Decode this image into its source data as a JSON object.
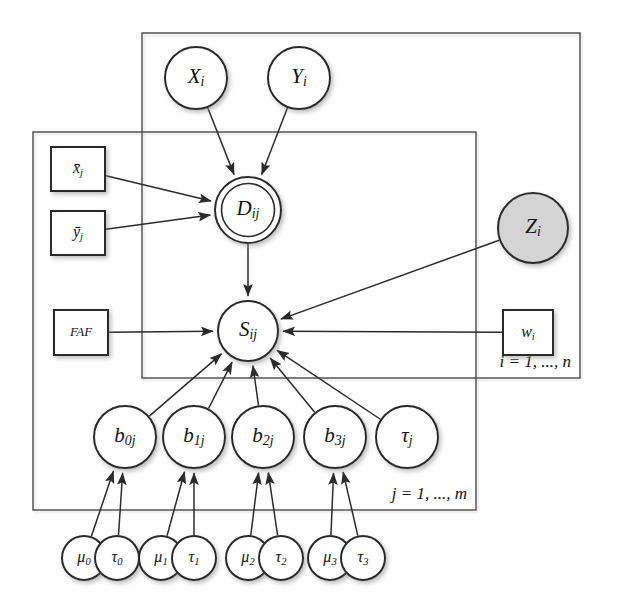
{
  "figure": {
    "kind": "bayesian-network-plate-diagram",
    "background_color": "#ffffff",
    "stroke_color": "#2b2b2b",
    "shaded_node_color": "#d4d4d4"
  },
  "plates": [
    {
      "id": "plate-i",
      "label": "i = 1, ..., n",
      "x": 142,
      "y": 33,
      "width": 438,
      "height": 345
    },
    {
      "id": "plate-j",
      "label": "j = 1, ..., m",
      "x": 33,
      "y": 132,
      "width": 443,
      "height": 378
    }
  ],
  "nodes": {
    "x_i": {
      "label": "X",
      "sub": "i",
      "shape": "circle",
      "style": "latent",
      "cx": 196,
      "cy": 78,
      "r": 31
    },
    "y_i": {
      "label": "Y",
      "sub": "i",
      "shape": "circle",
      "style": "latent",
      "cx": 299,
      "cy": 78,
      "r": 31
    },
    "d_ij": {
      "label": "D",
      "sub": "ij",
      "shape": "circle",
      "style": "observed",
      "cx": 248,
      "cy": 210,
      "r": 33
    },
    "s_ij": {
      "label": "S",
      "sub": "ij",
      "shape": "circle",
      "style": "latent",
      "cx": 248,
      "cy": 331,
      "r": 30
    },
    "z_i": {
      "label": "Z",
      "sub": "i",
      "shape": "circle",
      "style": "shaded",
      "cx": 533,
      "cy": 228,
      "r": 35
    },
    "xbar_j": {
      "label": "x̄",
      "sub": "j",
      "shape": "rect",
      "style": "fixed",
      "x": 51,
      "y": 147,
      "width": 54,
      "height": 44
    },
    "ybar_j": {
      "label": "ȳ",
      "sub": "j",
      "shape": "rect",
      "style": "fixed",
      "x": 51,
      "y": 211,
      "width": 54,
      "height": 44
    },
    "faf": {
      "label": "FAF",
      "sub": "",
      "shape": "rect",
      "style": "fixed",
      "x": 54,
      "y": 310,
      "width": 54,
      "height": 45
    },
    "w_i": {
      "label": "w",
      "sub": "i",
      "shape": "rect",
      "style": "fixed",
      "x": 503,
      "y": 310,
      "width": 50,
      "height": 45
    },
    "b0_j": {
      "label": "b",
      "sub": "0j",
      "shape": "circle",
      "style": "latent",
      "cx": 125,
      "cy": 437,
      "r": 31
    },
    "b1_j": {
      "label": "b",
      "sub": "1j",
      "shape": "circle",
      "style": "latent",
      "cx": 194,
      "cy": 437,
      "r": 31
    },
    "b2_j": {
      "label": "b",
      "sub": "2j",
      "shape": "circle",
      "style": "latent",
      "cx": 263,
      "cy": 437,
      "r": 31
    },
    "b3_j": {
      "label": "b",
      "sub": "3j",
      "shape": "circle",
      "style": "latent",
      "cx": 335,
      "cy": 437,
      "r": 31
    },
    "tau_j": {
      "label": "τ",
      "sub": "j",
      "shape": "circle",
      "style": "latent",
      "cx": 407,
      "cy": 437,
      "r": 31
    },
    "mu_0": {
      "label": "μ",
      "sub": "0",
      "shape": "circle",
      "style": "latent",
      "cx": 84,
      "cy": 558,
      "r": 22
    },
    "tau_0": {
      "label": "τ",
      "sub": "0",
      "shape": "circle",
      "style": "latent",
      "cx": 117,
      "cy": 558,
      "r": 22
    },
    "mu_1": {
      "label": "μ",
      "sub": "1",
      "shape": "circle",
      "style": "latent",
      "cx": 161,
      "cy": 558,
      "r": 22
    },
    "tau_1": {
      "label": "τ",
      "sub": "1",
      "shape": "circle",
      "style": "latent",
      "cx": 194,
      "cy": 558,
      "r": 22
    },
    "mu_2": {
      "label": "μ",
      "sub": "2",
      "shape": "circle",
      "style": "latent",
      "cx": 248,
      "cy": 558,
      "r": 22
    },
    "tau_2": {
      "label": "τ",
      "sub": "2",
      "shape": "circle",
      "style": "latent",
      "cx": 281,
      "cy": 558,
      "r": 22
    },
    "mu_3": {
      "label": "μ",
      "sub": "3",
      "shape": "circle",
      "style": "latent",
      "cx": 330,
      "cy": 558,
      "r": 22
    },
    "tau_3": {
      "label": "τ",
      "sub": "3",
      "shape": "circle",
      "style": "latent",
      "cx": 363,
      "cy": 558,
      "r": 22
    }
  },
  "node_order": [
    "x_i",
    "y_i",
    "d_ij",
    "s_ij",
    "z_i",
    "xbar_j",
    "ybar_j",
    "faf",
    "w_i",
    "b0_j",
    "b1_j",
    "b2_j",
    "b3_j",
    "tau_j",
    "mu_0",
    "tau_0",
    "mu_1",
    "tau_1",
    "mu_2",
    "tau_2",
    "mu_3",
    "tau_3"
  ],
  "edges": [
    {
      "from": "x_i",
      "to": "d_ij"
    },
    {
      "from": "y_i",
      "to": "d_ij"
    },
    {
      "from": "xbar_j",
      "to": "d_ij"
    },
    {
      "from": "ybar_j",
      "to": "d_ij"
    },
    {
      "from": "d_ij",
      "to": "s_ij"
    },
    {
      "from": "faf",
      "to": "s_ij"
    },
    {
      "from": "z_i",
      "to": "s_ij"
    },
    {
      "from": "w_i",
      "to": "s_ij"
    },
    {
      "from": "b0_j",
      "to": "s_ij"
    },
    {
      "from": "b1_j",
      "to": "s_ij"
    },
    {
      "from": "b2_j",
      "to": "s_ij"
    },
    {
      "from": "b3_j",
      "to": "s_ij"
    },
    {
      "from": "tau_j",
      "to": "s_ij"
    },
    {
      "from": "mu_0",
      "to": "b0_j"
    },
    {
      "from": "tau_0",
      "to": "b0_j"
    },
    {
      "from": "mu_1",
      "to": "b1_j"
    },
    {
      "from": "tau_1",
      "to": "b1_j"
    },
    {
      "from": "mu_2",
      "to": "b2_j"
    },
    {
      "from": "tau_2",
      "to": "b2_j"
    },
    {
      "from": "mu_3",
      "to": "b3_j"
    },
    {
      "from": "tau_3",
      "to": "b3_j"
    }
  ]
}
